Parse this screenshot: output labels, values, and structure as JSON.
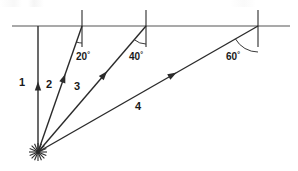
{
  "figure": {
    "canvas": {
      "width": 298,
      "height": 171
    },
    "colors": {
      "ray_stroke": "#2b2b2b",
      "baseline_stroke": "#8c8c8c",
      "tick_stroke": "#2b2b2b",
      "arc_stroke": "#3a3a3a",
      "text": "#1a1a1a",
      "background": "#ffffff"
    },
    "origin": {
      "x": 38,
      "y": 152
    },
    "baseline": {
      "y": 26,
      "x_start": 12,
      "x_end": 290
    },
    "rays": [
      {
        "label": "1",
        "angle_from_vertical_deg": 0,
        "angle_text": "",
        "end": {
          "x": 38,
          "y": 26
        },
        "label_pos": {
          "x": 22,
          "y": 86
        },
        "arrow_t": 0.56,
        "has_tick": false,
        "has_arc": false
      },
      {
        "label": "2",
        "angle_from_vertical_deg": 20,
        "angle_text": "20",
        "degree_symbol": "°",
        "end": {
          "x": 82,
          "y": 26
        },
        "label_pos": {
          "x": 49,
          "y": 88
        },
        "label_angle_pos": {
          "x": 76,
          "y": 60
        },
        "arrow_t": 0.62,
        "has_tick": true,
        "tick": {
          "x": 82,
          "y_top": 10,
          "y_bottom": 47
        },
        "has_arc": true,
        "arc_radius": 17
      },
      {
        "label": "3",
        "angle_from_vertical_deg": 40,
        "angle_text": "40",
        "degree_symbol": "°",
        "end": {
          "x": 146,
          "y": 26
        },
        "label_pos": {
          "x": 77,
          "y": 90
        },
        "label_angle_pos": {
          "x": 129,
          "y": 60
        },
        "arrow_t": 0.64,
        "has_tick": true,
        "tick": {
          "x": 146,
          "y_top": 10,
          "y_bottom": 47
        },
        "has_arc": true,
        "arc_radius": 18
      },
      {
        "label": "4",
        "angle_from_vertical_deg": 60,
        "angle_text": "60",
        "degree_symbol": "°",
        "end": {
          "x": 258,
          "y": 26
        },
        "label_pos": {
          "x": 138,
          "y": 110
        },
        "label_angle_pos": {
          "x": 226,
          "y": 60
        },
        "arrow_t": 0.63,
        "has_tick": true,
        "tick": {
          "x": 258,
          "y_top": 10,
          "y_bottom": 47
        },
        "has_arc": true,
        "arc_radius": 26
      }
    ],
    "origin_marker": {
      "type": "starburst",
      "spokes": 8,
      "radius": 9
    }
  }
}
